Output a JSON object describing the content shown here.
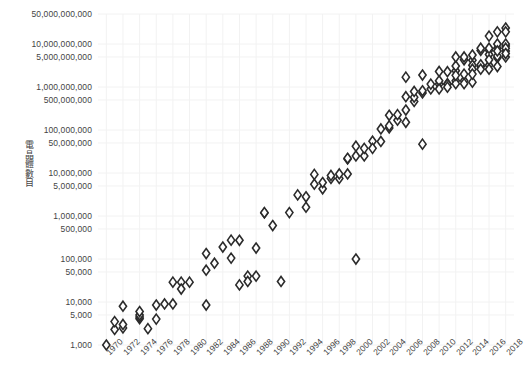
{
  "chart_data": {
    "type": "scatter",
    "title": "",
    "subtitle": "",
    "xlabel": "",
    "ylabel": "電晶體數目",
    "yscale": "log",
    "xscale": "linear",
    "grid": true,
    "legend": null,
    "xlim": [
      1969,
      2019
    ],
    "ylim": [
      1000,
      50000000000
    ],
    "xticks": [
      1970,
      1972,
      1974,
      1976,
      1978,
      1980,
      1982,
      1984,
      1986,
      1988,
      1990,
      1992,
      1994,
      1996,
      1998,
      2000,
      2002,
      2004,
      2006,
      2008,
      2010,
      2012,
      2014,
      2016,
      2018
    ],
    "xtick_labels": [
      "1970",
      "1972",
      "1974",
      "1976",
      "1978",
      "1980",
      "1982",
      "1984",
      "1986",
      "1988",
      "1990",
      "1992",
      "1994",
      "1996",
      "1998",
      "2000",
      "2002",
      "2004",
      "2006",
      "2008",
      "2010",
      "2012",
      "2014",
      "2016",
      "2018"
    ],
    "yticks": [
      1000,
      5000,
      10000,
      50000,
      100000,
      500000,
      1000000,
      5000000,
      10000000,
      50000000,
      100000000,
      500000000,
      1000000000,
      5000000000,
      10000000000,
      50000000000
    ],
    "ytick_labels": [
      "1,000",
      "5,000",
      "10,000",
      "50,000",
      "100,000",
      "500,000",
      "1,000,000",
      "5,000,000",
      "10,000,000",
      "50,000,000",
      "100,000,000",
      "500,000,000",
      "1,000,000,000",
      "5,000,000,000",
      "10,000,000,000",
      "50,000,000,000"
    ],
    "marker": "diamond",
    "marker_fill": "#ffffff",
    "marker_stroke": "#2b2b2b",
    "marker_size": 5,
    "grid_color": "#f2f2f2",
    "background": "#ffffff",
    "points": [
      [
        1970,
        1000
      ],
      [
        1971,
        2300
      ],
      [
        1971,
        3500
      ],
      [
        1972,
        2500
      ],
      [
        1972,
        3000
      ],
      [
        1972,
        8000
      ],
      [
        1974,
        4100
      ],
      [
        1974,
        4500
      ],
      [
        1974,
        5000
      ],
      [
        1974,
        6000
      ],
      [
        1975,
        2400
      ],
      [
        1976,
        4000
      ],
      [
        1976,
        8500
      ],
      [
        1977,
        9000
      ],
      [
        1978,
        9000
      ],
      [
        1978,
        29000
      ],
      [
        1979,
        29000
      ],
      [
        1979,
        20000
      ],
      [
        1980,
        29000
      ],
      [
        1982,
        8500
      ],
      [
        1982,
        134000
      ],
      [
        1982,
        55000
      ],
      [
        1983,
        80000
      ],
      [
        1984,
        190000
      ],
      [
        1985,
        105000
      ],
      [
        1985,
        275000
      ],
      [
        1986,
        25000
      ],
      [
        1986,
        273000
      ],
      [
        1987,
        40000
      ],
      [
        1987,
        30000
      ],
      [
        1988,
        180000
      ],
      [
        1988,
        40000
      ],
      [
        1989,
        1180000
      ],
      [
        1989,
        1200000
      ],
      [
        1990,
        600000
      ],
      [
        1991,
        30000
      ],
      [
        1992,
        1200000
      ],
      [
        1993,
        3100000
      ],
      [
        1994,
        1600000
      ],
      [
        1994,
        2800000
      ],
      [
        1995,
        5500000
      ],
      [
        1995,
        9300000
      ],
      [
        1996,
        4300000
      ],
      [
        1996,
        6000000
      ],
      [
        1997,
        7500000
      ],
      [
        1997,
        8800000
      ],
      [
        1998,
        7500000
      ],
      [
        1998,
        9500000
      ],
      [
        1999,
        9500000
      ],
      [
        1999,
        21300000
      ],
      [
        1999,
        22000000
      ],
      [
        2000,
        100000
      ],
      [
        2000,
        25000000
      ],
      [
        2000,
        42000000
      ],
      [
        2001,
        25000000
      ],
      [
        2001,
        37500000
      ],
      [
        2002,
        55000000
      ],
      [
        2002,
        37500000
      ],
      [
        2003,
        54300000
      ],
      [
        2003,
        105900000
      ],
      [
        2004,
        112000000
      ],
      [
        2004,
        125000000
      ],
      [
        2004,
        220000000
      ],
      [
        2005,
        169000000
      ],
      [
        2005,
        228000000
      ],
      [
        2006,
        151000000
      ],
      [
        2006,
        291000000
      ],
      [
        2006,
        596000000
      ],
      [
        2006,
        1700000000
      ],
      [
        2007,
        463000000
      ],
      [
        2007,
        582000000
      ],
      [
        2007,
        789000000
      ],
      [
        2008,
        731000000
      ],
      [
        2008,
        820000000
      ],
      [
        2008,
        47000000
      ],
      [
        2008,
        1900000000
      ],
      [
        2009,
        904000000
      ],
      [
        2009,
        1170000000
      ],
      [
        2010,
        1170000000
      ],
      [
        2010,
        1400000000
      ],
      [
        2010,
        2300000000
      ],
      [
        2010,
        904000000
      ],
      [
        2011,
        1200000000
      ],
      [
        2011,
        2270000000
      ],
      [
        2011,
        1160000000
      ],
      [
        2011,
        995000000
      ],
      [
        2012,
        1400000000
      ],
      [
        2012,
        2400000000
      ],
      [
        2012,
        3100000000
      ],
      [
        2012,
        5000000000
      ],
      [
        2012,
        1200000000
      ],
      [
        2012,
        1870000000
      ],
      [
        2013,
        1400000000
      ],
      [
        2013,
        4310000000
      ],
      [
        2013,
        5000000000
      ],
      [
        2013,
        2000000000
      ],
      [
        2013,
        1200000000
      ],
      [
        2014,
        1300000000
      ],
      [
        2014,
        4200000000
      ],
      [
        2014,
        5560000000
      ],
      [
        2014,
        3200000000
      ],
      [
        2014,
        2600000000
      ],
      [
        2014,
        2000000000
      ],
      [
        2015,
        3000000000
      ],
      [
        2015,
        7100000000
      ],
      [
        2015,
        3300000000
      ],
      [
        2015,
        2600000000
      ],
      [
        2015,
        8000000000
      ],
      [
        2016,
        3200000000
      ],
      [
        2016,
        7200000000
      ],
      [
        2016,
        15300000000
      ],
      [
        2016,
        5700000000
      ],
      [
        2016,
        4300000000
      ],
      [
        2016,
        8000000000
      ],
      [
        2016,
        2600000000
      ],
      [
        2017,
        4800000000
      ],
      [
        2017,
        19200000000
      ],
      [
        2017,
        5300000000
      ],
      [
        2017,
        8000000000
      ],
      [
        2017,
        10000000000
      ],
      [
        2017,
        6900000000
      ],
      [
        2017,
        3000000000
      ],
      [
        2018,
        23600000000
      ],
      [
        2018,
        9000000000
      ],
      [
        2018,
        10000000000
      ],
      [
        2018,
        6900000000
      ],
      [
        2018,
        8000000000
      ],
      [
        2018,
        19200000000
      ],
      [
        2018,
        5000000000
      ],
      [
        2018,
        6000000000
      ]
    ]
  },
  "axis": {
    "y_label_text": "電晶體數目"
  },
  "footer": {
    "note": ""
  }
}
